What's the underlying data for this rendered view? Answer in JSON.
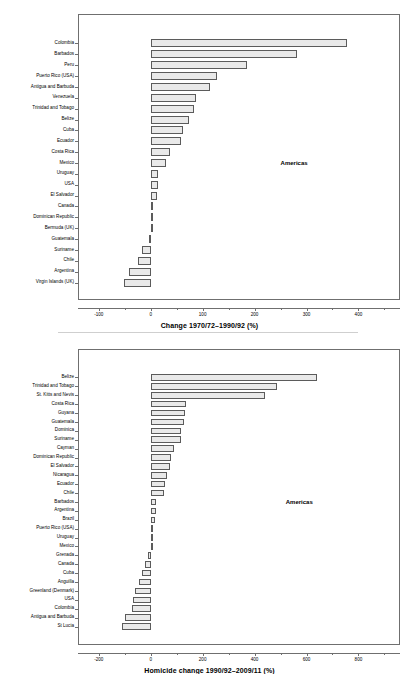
{
  "figure": {
    "panels": 2,
    "background": "#ffffff",
    "bar_fill": "#e9e9e9",
    "bar_stroke": "#5b5b5b",
    "frame_stroke": "#6f6f6f"
  },
  "chart_data": [
    {
      "type": "bar",
      "orientation": "horizontal",
      "title": "",
      "xlabel": "Change 1970/72–1990/92 (%)",
      "ylabel": "",
      "xlim": [
        -140,
        480
      ],
      "xticks": [
        -100,
        0,
        100,
        200,
        300,
        400
      ],
      "xticklabels": [
        "-100",
        "0",
        "100",
        "200",
        "300",
        "400"
      ],
      "grid": false,
      "legend": false,
      "annotations": [
        {
          "text": "Americas",
          "x": 250,
          "y_index": 11
        }
      ],
      "categories": [
        "Colombia",
        "Barbados",
        "Peru",
        "Puerto Rico (USA)",
        "Antigua and Barbuda",
        "Venezuela",
        "Trinidad and Tobago",
        "Belize",
        "Cuba",
        "Ecuador",
        "Costa Rica",
        "Mexico",
        "Uruguay",
        "USA",
        "El Salvador",
        "Canada",
        "Dominican Republic",
        "Bermuda (UK)",
        "Guatemala",
        "Suriname",
        "Chile",
        "Argentina",
        "Virgin Islands (UK)"
      ],
      "values": [
        378,
        282,
        185,
        128,
        114,
        88,
        84,
        73,
        63,
        58,
        38,
        30,
        15,
        14,
        13,
        2,
        1,
        0,
        -3,
        -16,
        -25,
        -42,
        -52
      ]
    },
    {
      "type": "bar",
      "orientation": "horizontal",
      "title": "",
      "xlabel": "Homicide change 1990/92–2009/11 (%)",
      "ylabel": "",
      "xlim": [
        -280,
        960
      ],
      "xticks": [
        -200,
        0,
        200,
        400,
        600,
        800
      ],
      "xticklabels": [
        "-200",
        "0",
        "200",
        "400",
        "600",
        "800"
      ],
      "grid": false,
      "legend": false,
      "annotations": [
        {
          "text": "Americas",
          "x": 520,
          "y_index": 14
        }
      ],
      "categories": [
        "Belize",
        "Trinidad and Tobago",
        "St. Kitts and Nevis",
        "Costa Rica",
        "Guyana",
        "Guatemala",
        "Dominica",
        "Suriname",
        "Cayman",
        "Dominican Republic",
        "El Salvador",
        "Nicaragua",
        "Ecuador",
        "Chile",
        "Barbados",
        "Argentina",
        "Brazil",
        "Puerto Rico (USA)",
        "Uruguay",
        "Mexico",
        "Grenada",
        "Canada",
        "Cuba",
        "Anguilla",
        "Greenland (Denmark)",
        "USA",
        "Colombia",
        "Antigua and Barbuda",
        "St Lucia"
      ],
      "values": [
        640,
        487,
        440,
        137,
        132,
        128,
        118,
        115,
        90,
        80,
        76,
        62,
        54,
        50,
        20,
        19,
        18,
        8,
        6,
        2,
        -10,
        -22,
        -32,
        -44,
        -60,
        -68,
        -72,
        -100,
        -112
      ]
    }
  ]
}
